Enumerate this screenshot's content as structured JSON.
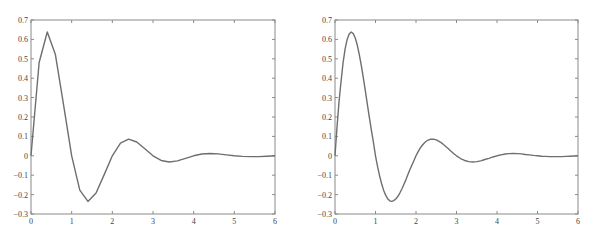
{
  "chart_data": [
    {
      "type": "line",
      "title": "",
      "xlabel": "",
      "ylabel": "",
      "xlim": [
        0,
        6
      ],
      "ylim": [
        -0.3,
        0.7
      ],
      "xticks": [
        0,
        1,
        2,
        3,
        4,
        5,
        6
      ],
      "xtick_labels": [
        "0",
        "1",
        "2",
        "3",
        "4",
        "5",
        "6"
      ],
      "yticks": [
        0.7,
        0.6,
        0.5,
        0.4,
        0.3,
        0.2,
        0.1,
        0,
        -0.1,
        -0.2,
        -0.3
      ],
      "ytick_labels": [
        "0.7",
        "0.6",
        "0.5",
        "0.4",
        "0.3",
        "0.2",
        "0.1",
        "0",
        "−0.1",
        "−0.2",
        "−0.3"
      ],
      "grid": false,
      "legend": null,
      "description": "Damped oscillation sampled coarsely (step 0.2), piecewise linear",
      "series": [
        {
          "name": "coarse",
          "x": [
            0,
            0.2,
            0.4,
            0.6,
            0.8,
            1.0,
            1.2,
            1.4,
            1.6,
            1.8,
            2.0,
            2.2,
            2.4,
            2.6,
            2.8,
            3.0,
            3.2,
            3.4,
            3.6,
            3.8,
            4.0,
            4.2,
            4.4,
            4.6,
            4.8,
            5.0,
            5.2,
            5.4,
            5.6,
            5.8,
            6.0
          ],
          "y": [
            0,
            0.481,
            0.638,
            0.522,
            0.264,
            0,
            -0.177,
            -0.235,
            -0.192,
            -0.097,
            0,
            0.065,
            0.086,
            0.071,
            0.036,
            0,
            -0.024,
            -0.032,
            -0.026,
            -0.013,
            0,
            0.009,
            0.012,
            0.01,
            0.005,
            0,
            -0.003,
            -0.004,
            -0.004,
            -0.002,
            0
          ]
        }
      ]
    },
    {
      "type": "line",
      "title": "",
      "xlabel": "",
      "ylabel": "",
      "xlim": [
        0,
        6
      ],
      "ylim": [
        -0.3,
        0.7
      ],
      "xticks": [
        0,
        1,
        2,
        3,
        4,
        5,
        6
      ],
      "xtick_labels": [
        "0",
        "1",
        "2",
        "3",
        "4",
        "5",
        "6"
      ],
      "yticks": [
        0.7,
        0.6,
        0.5,
        0.4,
        0.3,
        0.2,
        0.1,
        0,
        -0.1,
        -0.2,
        -0.3
      ],
      "ytick_labels": [
        "0.7",
        "0.6",
        "0.5",
        "0.4",
        "0.3",
        "0.2",
        "0.1",
        "0",
        "−0.1",
        "−0.2",
        "−0.3"
      ],
      "grid": false,
      "legend": null,
      "description": "Same damped oscillation sampled finely (step 0.05), smooth curve",
      "series": [
        {
          "name": "fine",
          "x": [
            0,
            0.05,
            0.1,
            0.15,
            0.2,
            0.25,
            0.3,
            0.35,
            0.4,
            0.45,
            0.5,
            0.55,
            0.6,
            0.65,
            0.7,
            0.75,
            0.8,
            0.85,
            0.9,
            0.95,
            1.0,
            1.05,
            1.1,
            1.15,
            1.2,
            1.25,
            1.3,
            1.35,
            1.4,
            1.45,
            1.5,
            1.55,
            1.6,
            1.65,
            1.7,
            1.75,
            1.8,
            1.85,
            1.9,
            1.95,
            2.0,
            2.05,
            2.1,
            2.15,
            2.2,
            2.25,
            2.3,
            2.35,
            2.4,
            2.45,
            2.5,
            2.55,
            2.6,
            2.65,
            2.7,
            2.75,
            2.8,
            2.85,
            2.9,
            2.95,
            3.0,
            3.1,
            3.2,
            3.3,
            3.4,
            3.5,
            3.6,
            3.7,
            3.8,
            3.9,
            4.0,
            4.1,
            4.2,
            4.3,
            4.4,
            4.5,
            4.6,
            4.7,
            4.8,
            4.9,
            5.0,
            5.1,
            5.2,
            5.3,
            5.4,
            5.5,
            5.6,
            5.7,
            5.8,
            5.9,
            6.0
          ],
          "y": [
            0,
            0.149,
            0.28,
            0.384,
            0.481,
            0.551,
            0.6,
            0.628,
            0.638,
            0.63,
            0.607,
            0.571,
            0.522,
            0.465,
            0.402,
            0.333,
            0.264,
            0.196,
            0.13,
            0.068,
            0,
            -0.054,
            -0.102,
            -0.143,
            -0.177,
            -0.203,
            -0.221,
            -0.232,
            -0.235,
            -0.231,
            -0.223,
            -0.21,
            -0.192,
            -0.171,
            -0.148,
            -0.124,
            -0.097,
            -0.071,
            -0.047,
            -0.024,
            0,
            0.02,
            0.038,
            0.053,
            0.065,
            0.075,
            0.081,
            0.085,
            0.086,
            0.085,
            0.082,
            0.077,
            0.071,
            0.063,
            0.054,
            0.045,
            0.036,
            0.026,
            0.017,
            0.008,
            0,
            -0.014,
            -0.024,
            -0.03,
            -0.032,
            -0.03,
            -0.026,
            -0.019,
            -0.013,
            -0.006,
            0,
            0.005,
            0.009,
            0.011,
            0.012,
            0.011,
            0.01,
            0.007,
            0.005,
            0.002,
            0,
            -0.002,
            -0.003,
            -0.004,
            -0.004,
            -0.004,
            -0.004,
            -0.003,
            -0.002,
            -0.001,
            0
          ]
        }
      ]
    }
  ]
}
